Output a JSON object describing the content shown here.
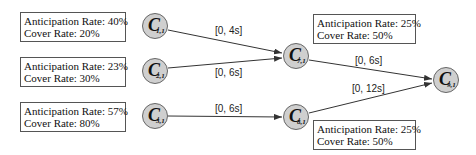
{
  "nodes": [
    {
      "id": "C1",
      "letter": "C",
      "subscript": "1,1",
      "cx": 155,
      "cy": 26
    },
    {
      "id": "C2",
      "letter": "C",
      "subscript": "2,1",
      "cx": 155,
      "cy": 71
    },
    {
      "id": "C3",
      "letter": "C",
      "subscript": "3,1",
      "cx": 155,
      "cy": 116
    },
    {
      "id": "C7",
      "letter": "C",
      "subscript": "7,1",
      "cx": 296,
      "cy": 56
    },
    {
      "id": "C8",
      "letter": "C",
      "subscript": "8,1",
      "cx": 296,
      "cy": 117
    },
    {
      "id": "C9",
      "letter": "C",
      "subscript": "9,1",
      "cx": 446,
      "cy": 80
    }
  ],
  "edges": [
    {
      "from": "C1",
      "to": "C7",
      "label": "[0, 4s]"
    },
    {
      "from": "C2",
      "to": "C7",
      "label": "[0, 6s]"
    },
    {
      "from": "C3",
      "to": "C8",
      "label": "[0, 6s]"
    },
    {
      "from": "C7",
      "to": "C9",
      "label": "[0, 6s]"
    },
    {
      "from": "C8",
      "to": "C9",
      "label": "[0, 12s]"
    }
  ],
  "boxes": [
    {
      "node": "C1",
      "anticipation": "Anticipation Rate: 40%",
      "cover": "Cover Rate: 20%"
    },
    {
      "node": "C2",
      "anticipation": "Anticipation Rate: 23%",
      "cover": "Cover Rate: 30%"
    },
    {
      "node": "C3",
      "anticipation": "Anticipation Rate: 57%",
      "cover": "Cover Rate: 80%"
    },
    {
      "node": "C7",
      "anticipation": "Anticipation Rate: 25%",
      "cover": "Cover Rate: 50%"
    },
    {
      "node": "C8",
      "anticipation": "Anticipation Rate: 25%",
      "cover": "Cover Rate: 50%"
    }
  ],
  "colors": {
    "node_fill": "#cfcfcf",
    "node_stroke": "#666666",
    "edge": "#333333",
    "box_border": "#555555"
  }
}
